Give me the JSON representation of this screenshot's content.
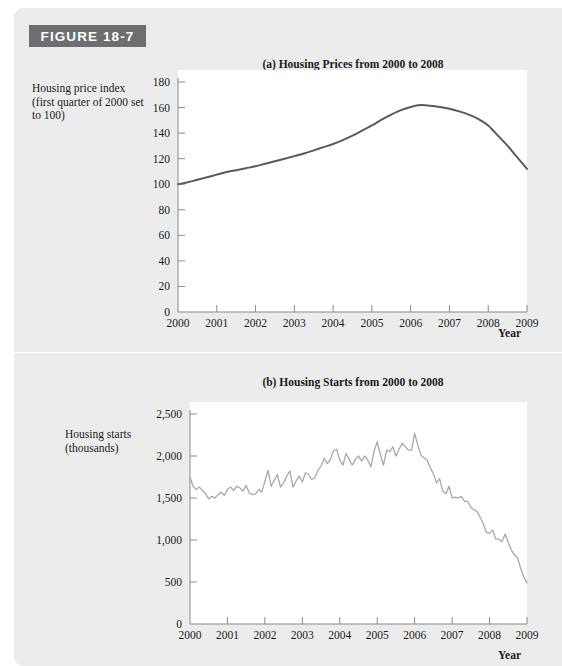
{
  "figure": {
    "tag_label": "FIGURE 18-7",
    "tag_bg_color": "#6e6e70",
    "card_bg_color": "#ececed"
  },
  "chart_data": [
    {
      "id": "a",
      "type": "line",
      "title": "(a) Housing Prices from 2000 to 2008",
      "xlabel": "Year",
      "ylabel": "Housing price index (first quarter of 2000 set to 100)",
      "line_color": "#5a5a5a",
      "grid": false,
      "legend": "none",
      "xlim": [
        2000,
        2009
      ],
      "ylim": [
        0,
        180
      ],
      "ytick_values": [
        0,
        20,
        40,
        60,
        80,
        100,
        120,
        140,
        160,
        180
      ],
      "ytick_labels": [
        "0",
        "20",
        "40",
        "60",
        "80",
        "100",
        "120",
        "140",
        "160",
        "180"
      ],
      "xtick_values": [
        2000,
        2001,
        2002,
        2003,
        2004,
        2005,
        2006,
        2007,
        2008,
        2009
      ],
      "xtick_labels": [
        "2000",
        "2001",
        "2002",
        "2003",
        "2004",
        "2005",
        "2006",
        "2007",
        "2008",
        "2009"
      ],
      "x": [
        2000.0,
        2000.25,
        2000.5,
        2000.75,
        2001.0,
        2001.25,
        2001.5,
        2001.75,
        2002.0,
        2002.25,
        2002.5,
        2002.75,
        2003.0,
        2003.25,
        2003.5,
        2003.75,
        2004.0,
        2004.25,
        2004.5,
        2004.75,
        2005.0,
        2005.25,
        2005.5,
        2005.75,
        2006.0,
        2006.25,
        2006.5,
        2006.75,
        2007.0,
        2007.25,
        2007.5,
        2007.75,
        2008.0,
        2008.25,
        2008.5,
        2008.75,
        2009.0
      ],
      "y": [
        100,
        101.5,
        103.5,
        105.5,
        107.5,
        109.5,
        111,
        112.5,
        114,
        116,
        118,
        120,
        122,
        124,
        126.5,
        129,
        131.5,
        134.5,
        138,
        142,
        146,
        150.5,
        154.5,
        158,
        160.5,
        162,
        161.5,
        160.5,
        159,
        157,
        154.5,
        151,
        146,
        138,
        130,
        121,
        112
      ]
    },
    {
      "id": "b",
      "type": "line",
      "title": "(b) Housing Starts from 2000 to 2008",
      "xlabel": "Year",
      "ylabel": "Housing starts (thousands)",
      "line_color": "#a9a9a9",
      "grid": false,
      "legend": "none",
      "xlim": [
        2000,
        2009
      ],
      "ylim": [
        0,
        2500
      ],
      "ytick_values": [
        0,
        500,
        1000,
        1500,
        2000,
        2500
      ],
      "ytick_labels": [
        "0",
        "500",
        "1,000",
        "1,500",
        "2,000",
        "2,500"
      ],
      "xtick_values": [
        2000,
        2001,
        2002,
        2003,
        2004,
        2005,
        2006,
        2007,
        2008,
        2009
      ],
      "xtick_labels": [
        "2000",
        "2001",
        "2002",
        "2003",
        "2004",
        "2005",
        "2006",
        "2007",
        "2008",
        "2009"
      ],
      "x": [
        2000.0,
        2000.083,
        2000.167,
        2000.25,
        2000.333,
        2000.417,
        2000.5,
        2000.583,
        2000.667,
        2000.75,
        2000.833,
        2000.917,
        2001.0,
        2001.083,
        2001.167,
        2001.25,
        2001.333,
        2001.417,
        2001.5,
        2001.583,
        2001.667,
        2001.75,
        2001.833,
        2001.917,
        2002.0,
        2002.083,
        2002.167,
        2002.25,
        2002.333,
        2002.417,
        2002.5,
        2002.583,
        2002.667,
        2002.75,
        2002.833,
        2002.917,
        2003.0,
        2003.083,
        2003.167,
        2003.25,
        2003.333,
        2003.417,
        2003.5,
        2003.583,
        2003.667,
        2003.75,
        2003.833,
        2003.917,
        2004.0,
        2004.083,
        2004.167,
        2004.25,
        2004.333,
        2004.417,
        2004.5,
        2004.583,
        2004.667,
        2004.75,
        2004.833,
        2004.917,
        2005.0,
        2005.083,
        2005.167,
        2005.25,
        2005.333,
        2005.417,
        2005.5,
        2005.583,
        2005.667,
        2005.75,
        2005.833,
        2005.917,
        2006.0,
        2006.083,
        2006.167,
        2006.25,
        2006.333,
        2006.417,
        2006.5,
        2006.583,
        2006.667,
        2006.75,
        2006.833,
        2006.917,
        2007.0,
        2007.083,
        2007.167,
        2007.25,
        2007.333,
        2007.417,
        2007.5,
        2007.583,
        2007.667,
        2007.75,
        2007.833,
        2007.917,
        2008.0,
        2008.083,
        2008.167,
        2008.25,
        2008.333,
        2008.417,
        2008.5,
        2008.583,
        2008.667,
        2008.75,
        2008.833,
        2008.917,
        2009.0
      ],
      "y": [
        1750,
        1640,
        1600,
        1630,
        1590,
        1550,
        1490,
        1520,
        1500,
        1540,
        1570,
        1530,
        1600,
        1630,
        1590,
        1640,
        1620,
        1580,
        1650,
        1560,
        1540,
        1550,
        1600,
        1570,
        1700,
        1830,
        1640,
        1710,
        1780,
        1630,
        1680,
        1760,
        1820,
        1630,
        1700,
        1760,
        1690,
        1800,
        1780,
        1720,
        1740,
        1830,
        1880,
        1970,
        1910,
        1960,
        2060,
        2080,
        1950,
        1890,
        2030,
        1960,
        1890,
        1960,
        2000,
        1940,
        2000,
        1950,
        1870,
        2060,
        2170,
        2020,
        1890,
        2070,
        2050,
        2110,
        2000,
        2080,
        2150,
        2110,
        2070,
        2070,
        2270,
        2130,
        2010,
        1980,
        1950,
        1860,
        1790,
        1680,
        1730,
        1580,
        1550,
        1640,
        1500,
        1510,
        1500,
        1520,
        1460,
        1460,
        1390,
        1360,
        1340,
        1270,
        1190,
        1090,
        1080,
        1120,
        1010,
        1010,
        980,
        1070,
        970,
        880,
        820,
        790,
        660,
        560,
        490
      ]
    }
  ]
}
